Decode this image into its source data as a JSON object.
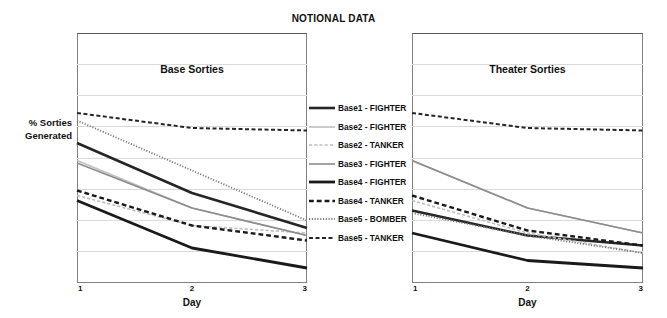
{
  "figure": {
    "title": "NOTIONAL DATA",
    "ylabel_line1": "% Sorties",
    "ylabel_line2": "Generated",
    "background": "#ffffff",
    "frame_color": "#808080",
    "gridline_color": "#d9d9d9"
  },
  "panels": [
    {
      "id": "base",
      "title": "Base Sorties",
      "xlabel": "Day"
    },
    {
      "id": "theater",
      "title": "Theater Sorties",
      "xlabel": "Day"
    }
  ],
  "legend": {
    "position": "center-between-panels",
    "entries": [
      {
        "label": "Base1 - FIGHTER",
        "color": "#262626",
        "style": "solid",
        "width": 2.6
      },
      {
        "label": "Base2 - FIGHTER",
        "color": "#bfbfbf",
        "style": "solid",
        "width": 1.6
      },
      {
        "label": "Base2 - TANKER",
        "color": "#bfbfbf",
        "style": "dashed",
        "width": 1.6
      },
      {
        "label": "Base3 - FIGHTER",
        "color": "#8c8c8c",
        "style": "solid",
        "width": 1.6
      },
      {
        "label": "Base4 - FIGHTER",
        "color": "#1a1a1a",
        "style": "solid",
        "width": 2.8
      },
      {
        "label": "Base4 - TANKER",
        "color": "#1a1a1a",
        "style": "dashed",
        "width": 2.4
      },
      {
        "label": "Base5 - BOMBER",
        "color": "#737373",
        "style": "dotted",
        "width": 1.8
      },
      {
        "label": "Base5 - TANKER",
        "color": "#262626",
        "style": "dashed",
        "width": 2.0
      }
    ]
  },
  "chart_data": {
    "type": "line",
    "title": "NOTIONAL DATA",
    "xlabel": "Day",
    "ylabel": "% Sorties Generated",
    "x": [
      1,
      2,
      3
    ],
    "xticks": [
      "1",
      "2",
      "3"
    ],
    "xlim": [
      1,
      3
    ],
    "ylim": [
      0,
      100
    ],
    "yticks_labeled": false,
    "grid": "horizontal",
    "gridline_count": 7,
    "legend_position": "center",
    "panels": [
      {
        "name": "Base Sorties",
        "series": [
          {
            "name": "Base1 - FIGHTER",
            "values": [
              56,
              36,
              22
            ]
          },
          {
            "name": "Base2 - FIGHTER",
            "values": [
              49,
              30,
              19
            ]
          },
          {
            "name": "Base2 - TANKER",
            "values": [
              35,
              23,
              20
            ]
          },
          {
            "name": "Base3 - FIGHTER",
            "values": [
              48,
              30,
              19
            ]
          },
          {
            "name": "Base4 - FIGHTER",
            "values": [
              33,
              14,
              6
            ]
          },
          {
            "name": "Base4 - TANKER",
            "values": [
              37,
              23,
              17
            ]
          },
          {
            "name": "Base5 - BOMBER",
            "values": [
              65,
              45,
              25
            ]
          },
          {
            "name": "Base5 - TANKER",
            "values": [
              68,
              62,
              61
            ]
          }
        ]
      },
      {
        "name": "Theater Sorties",
        "series": [
          {
            "name": "Base1 - FIGHTER",
            "values": [
              29,
              19,
              15
            ]
          },
          {
            "name": "Base2 - FIGHTER",
            "values": [
              49,
              30,
              20
            ]
          },
          {
            "name": "Base2 - TANKER",
            "values": [
              33,
              20,
              12
            ]
          },
          {
            "name": "Base3 - FIGHTER",
            "values": [
              49,
              30,
              20
            ]
          },
          {
            "name": "Base4 - FIGHTER",
            "values": [
              20,
              9,
              6
            ]
          },
          {
            "name": "Base4 - TANKER",
            "values": [
              35,
              21,
              15
            ]
          },
          {
            "name": "Base5 - BOMBER",
            "values": [
              28,
              19,
              12
            ]
          },
          {
            "name": "Base5 - TANKER",
            "values": [
              68,
              62,
              61
            ]
          }
        ]
      }
    ]
  }
}
